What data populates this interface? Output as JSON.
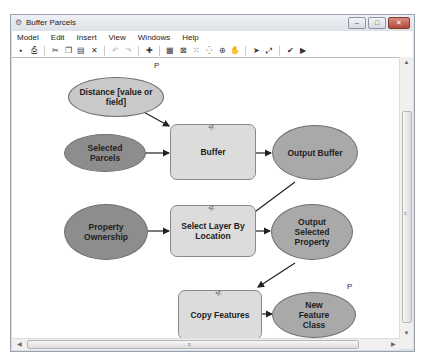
{
  "window": {
    "title": "Buffer Parcels",
    "controls": {
      "minimize": "–",
      "maximize": "□",
      "close": "✕"
    }
  },
  "menu": [
    "Model",
    "Edit",
    "Insert",
    "View",
    "Windows",
    "Help"
  ],
  "toolbar": [
    {
      "name": "save-icon",
      "glyph": "▪"
    },
    {
      "name": "print-icon",
      "glyph": "⎙"
    },
    {
      "name": "cut-icon",
      "glyph": "✂"
    },
    {
      "name": "copy-icon",
      "glyph": "❐"
    },
    {
      "name": "paste-icon",
      "glyph": "▤"
    },
    {
      "name": "delete-icon",
      "glyph": "✕"
    },
    {
      "name": "undo-icon",
      "glyph": "↶",
      "dim": true
    },
    {
      "name": "redo-icon",
      "glyph": "↷",
      "dim": true
    },
    {
      "name": "add-data-icon",
      "glyph": "✚"
    },
    {
      "name": "auto-layout-icon",
      "glyph": "▦"
    },
    {
      "name": "full-extent-icon",
      "glyph": "⊠"
    },
    {
      "name": "fixed-zoom-in-icon",
      "glyph": "⁙"
    },
    {
      "name": "fixed-zoom-out-icon",
      "glyph": "⁛"
    },
    {
      "name": "zoom-in-icon",
      "glyph": "⊕"
    },
    {
      "name": "pan-icon",
      "glyph": "✋"
    },
    {
      "name": "select-icon",
      "glyph": "➤"
    },
    {
      "name": "connect-icon",
      "glyph": "⤢"
    },
    {
      "name": "validate-icon",
      "glyph": "✔"
    },
    {
      "name": "run-icon",
      "glyph": "▶"
    }
  ],
  "diagram": {
    "parameter_marker": "P",
    "nodes": {
      "distance": "Distance [value or field]",
      "selected_parcels": "Selected Parcels",
      "buffer": "Buffer",
      "output_buffer": "Output Buffer",
      "property_ownership": "Property Ownership",
      "select_layer": "Select Layer By Location",
      "output_selected": "Output Selected Property",
      "copy_features": "Copy Features",
      "new_feature_class": "New Feature Class"
    },
    "colors": {
      "input_light": "#c9c9c9",
      "input_dark": "#8d8d8d",
      "output": "#a9a9a9",
      "tool": "#dcdcdc"
    }
  },
  "scrollbars": {
    "grip": "≡"
  }
}
